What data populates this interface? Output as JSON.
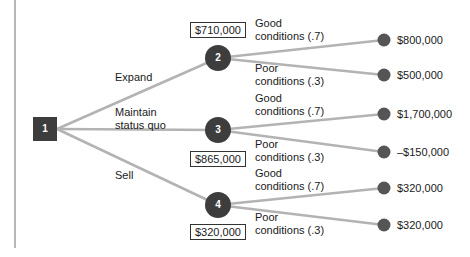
{
  "diagram": {
    "type": "decision-tree",
    "colors": {
      "line": "#b3b3b3",
      "node_fill": "#3d3d3d",
      "end_node_fill": "#555555",
      "border": "#666666"
    },
    "decision_node": {
      "id": "1",
      "label": "1"
    },
    "branches": [
      {
        "label": "Expand",
        "chance_node": "2",
        "expected_value": "$710,000",
        "outcomes": [
          {
            "label_line1": "Good",
            "label_line2": "conditions (.7)",
            "payoff": "$800,000"
          },
          {
            "label_line1": "Poor",
            "label_line2": "conditions (.3)",
            "payoff": "$500,000"
          }
        ]
      },
      {
        "label_line1": "Maintain",
        "label_line2": "status quo",
        "chance_node": "3",
        "expected_value": "$865,000",
        "outcomes": [
          {
            "label_line1": "Good",
            "label_line2": "conditions (.7)",
            "payoff": "$1,700,000"
          },
          {
            "label_line1": "Poor",
            "label_line2": "conditions (.3)",
            "payoff": "–$150,000"
          }
        ]
      },
      {
        "label": "Sell",
        "chance_node": "4",
        "expected_value": "$320,000",
        "outcomes": [
          {
            "label_line1": "Good",
            "label_line2": "conditions (.7)",
            "payoff": "$320,000"
          },
          {
            "label_line1": "Poor",
            "label_line2": "conditions (.3)",
            "payoff": "$320,000"
          }
        ]
      }
    ]
  }
}
